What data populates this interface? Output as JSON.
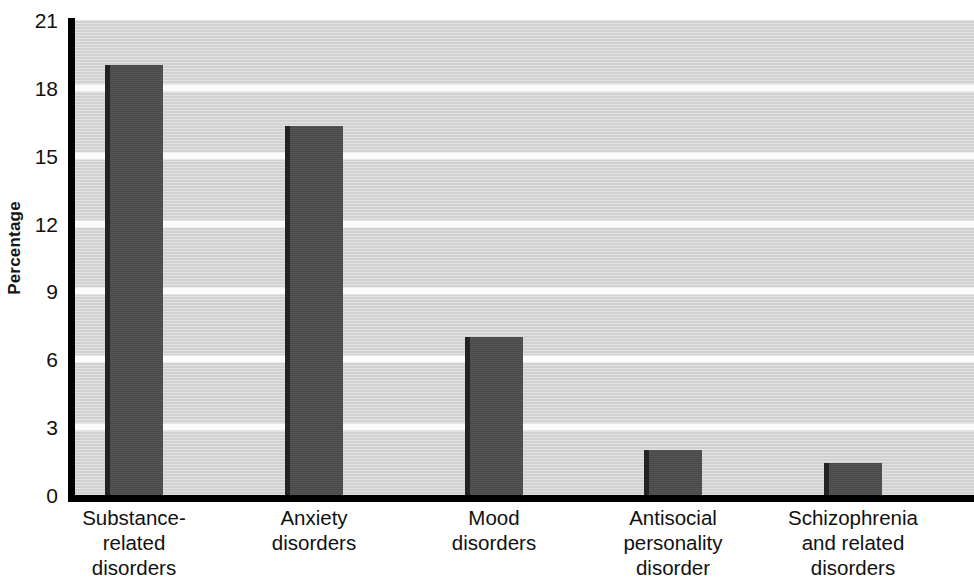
{
  "chart_data": {
    "type": "bar",
    "title": "",
    "xlabel": "",
    "ylabel": "Percentage",
    "ylim": [
      0,
      21
    ],
    "yticks": [
      0,
      3,
      6,
      9,
      12,
      15,
      18,
      21
    ],
    "grid": true,
    "legend": false,
    "categories": [
      "Substance-related disorders",
      "Anxiety disorders",
      "Mood disorders",
      "Antisocial personality disorder",
      "Schizophrenia and related disorders"
    ],
    "category_lines": [
      [
        "Substance-",
        "related",
        "disorders"
      ],
      [
        "Anxiety",
        "disorders"
      ],
      [
        "Mood",
        "disorders"
      ],
      [
        "Antisocial",
        "personality",
        "disorder"
      ],
      [
        "Schizophrenia",
        "and related",
        "disorders"
      ]
    ],
    "values": [
      19.0,
      16.3,
      7.0,
      2.0,
      1.4
    ],
    "colors": {
      "bar_fill": "#4d4d4d",
      "bar_edge": "#232323",
      "plot_background": "#d6d6d6",
      "gridline": "#fbfbfb",
      "axis": "#000000",
      "text": "#111111",
      "page_background": "#ffffff"
    }
  },
  "axis": {
    "y_title": "Percentage",
    "tick_labels": [
      "21",
      "18",
      "15",
      "12",
      "9",
      "6",
      "3",
      "0"
    ]
  }
}
